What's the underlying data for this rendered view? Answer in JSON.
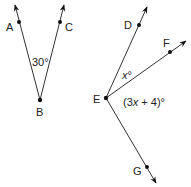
{
  "figures": [
    {
      "name": "angle-ABC",
      "vertex": {
        "label": "B",
        "x": 40,
        "y": 100
      },
      "rays": [
        {
          "through": {
            "label": "A",
            "x": 19,
            "y": 22
          },
          "tip": {
            "x": 15,
            "y": 5
          }
        },
        {
          "through": {
            "label": "C",
            "x": 60,
            "y": 22
          },
          "tip": {
            "x": 64,
            "y": 5
          }
        }
      ],
      "angle_label": "30°"
    },
    {
      "name": "angles-DEF-FEG",
      "vertex": {
        "label": "E",
        "x": 106,
        "y": 98
      },
      "rays": [
        {
          "through": {
            "label": "D",
            "x": 139,
            "y": 25
          },
          "tip": {
            "x": 147,
            "y": 7
          }
        },
        {
          "through": {
            "label": "F",
            "x": 170,
            "y": 52
          },
          "tip": {
            "x": 186,
            "y": 41
          }
        },
        {
          "through": {
            "label": "G",
            "x": 147,
            "y": 167
          },
          "tip": {
            "x": 156,
            "y": 183
          }
        }
      ],
      "angle_labels": {
        "DEF_var": "x",
        "DEF_deg": "°",
        "FEG_prefix": "(3",
        "FEG_var": "x",
        "FEG_suffix": " + 4)°"
      }
    }
  ],
  "labels": {
    "A": "A",
    "B": "B",
    "C": "C",
    "D": "D",
    "E": "E",
    "F": "F",
    "G": "G",
    "angle_ABC": "30°"
  },
  "colors": {
    "stroke": "#333333",
    "point": "#111111",
    "text": "#222222"
  }
}
